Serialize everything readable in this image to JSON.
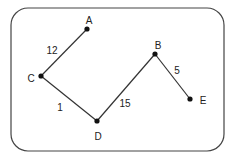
{
  "diagram": {
    "type": "weighted-graph",
    "nodes": [
      {
        "id": "A",
        "label": "A",
        "x": 87,
        "y": 29,
        "lx": 89,
        "ly": 24
      },
      {
        "id": "B",
        "label": "B",
        "x": 155,
        "y": 54,
        "lx": 158,
        "ly": 49
      },
      {
        "id": "C",
        "label": "C",
        "x": 41,
        "y": 76,
        "lx": 31,
        "ly": 82
      },
      {
        "id": "D",
        "label": "D",
        "x": 97,
        "y": 121,
        "lx": 98,
        "ly": 140
      },
      {
        "id": "E",
        "label": "E",
        "x": 190,
        "y": 99,
        "lx": 203,
        "ly": 104
      }
    ],
    "edges": [
      {
        "from": "A",
        "to": "C",
        "weight": "12",
        "lx": 52,
        "ly": 54
      },
      {
        "from": "C",
        "to": "D",
        "weight": "1",
        "lx": 60,
        "ly": 111
      },
      {
        "from": "D",
        "to": "B",
        "weight": "15",
        "lx": 125,
        "ly": 107
      },
      {
        "from": "B",
        "to": "E",
        "weight": "5",
        "lx": 177,
        "ly": 74
      }
    ],
    "colors": {
      "stroke": "#333333",
      "node": "#111111",
      "border": "#444444"
    }
  }
}
